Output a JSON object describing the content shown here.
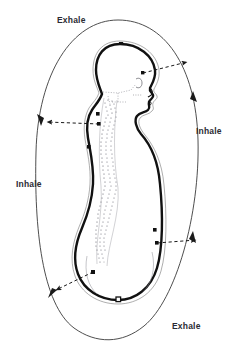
{
  "diagram": {
    "figure_type": "anatomical-diagram",
    "background_color": "#ffffff",
    "ink_color": "#1a1a1a",
    "label_color": "#2b2b33",
    "outer_loop": {
      "name": "breath-cycle-ellipse",
      "description": "large vertical ellipse enclosing the body representing one full breath cycle",
      "line_color": "#3a3a3a"
    },
    "body": {
      "name": "seated-body-profile",
      "description": "side profile of head, neck, back and seat drawn with a heavy outline",
      "outline_color": "#111111",
      "spine": {
        "name": "spine-vertebrae",
        "description": "stippled column of vertebrae following the curve of the back",
        "stipple_color": "#55555f"
      }
    },
    "labels": [
      {
        "id": "exhale-top",
        "text": "Exhale",
        "position": "top-left"
      },
      {
        "id": "inhale-right",
        "text": "Inhale",
        "position": "right"
      },
      {
        "id": "inhale-left",
        "text": "Inhale",
        "position": "left"
      },
      {
        "id": "exhale-bottom",
        "text": "Exhale",
        "position": "bottom-right"
      }
    ],
    "arrows": [
      {
        "id": "arrow-upper-right",
        "direction": "up-right",
        "style": "dashed"
      },
      {
        "id": "arrow-left",
        "direction": "left",
        "style": "dashed"
      },
      {
        "id": "arrow-lower-right",
        "direction": "right",
        "style": "dashed"
      },
      {
        "id": "arrow-lower-left",
        "direction": "down-left",
        "style": "dashed"
      }
    ],
    "markers": [
      {
        "id": "marker-crown",
        "shape": "filled-square",
        "location": "top of head"
      },
      {
        "id": "marker-nape",
        "shape": "filled-square",
        "location": "back of neck"
      },
      {
        "id": "marker-upper-back",
        "shape": "filled-square",
        "location": "upper back"
      },
      {
        "id": "marker-mid-back",
        "shape": "filled-square",
        "location": "mid back"
      },
      {
        "id": "marker-sacrum",
        "shape": "filled-square",
        "location": "lower back"
      },
      {
        "id": "marker-knee",
        "shape": "filled-square",
        "location": "front of knee"
      },
      {
        "id": "marker-shin",
        "shape": "filled-square",
        "location": "lower shin"
      },
      {
        "id": "marker-seat",
        "shape": "open-square",
        "location": "bottom of seat"
      }
    ]
  }
}
